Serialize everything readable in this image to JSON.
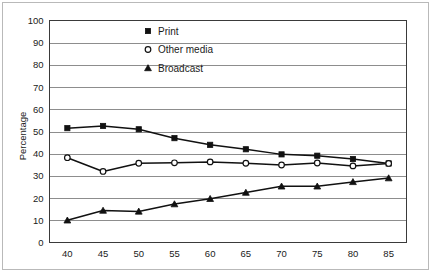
{
  "chart_data": {
    "type": "line",
    "title": "",
    "xlabel": "",
    "ylabel": "Percentage",
    "x": [
      40,
      45,
      50,
      55,
      60,
      65,
      70,
      75,
      80,
      85
    ],
    "xticklabels": [
      "40",
      "45",
      "50",
      "55",
      "60",
      "65",
      "70",
      "75",
      "80",
      "85"
    ],
    "yticklabels": [
      "0",
      "10",
      "20",
      "30",
      "40",
      "50",
      "60",
      "70",
      "80",
      "90",
      "100"
    ],
    "xlim": [
      37.5,
      87.5
    ],
    "ylim": [
      0,
      100
    ],
    "ytick_step": 10,
    "grid": true,
    "grid_axis": "y",
    "legend_position": "upper center",
    "series": [
      {
        "name": "Print",
        "marker": "filled-square",
        "color": "#111111",
        "values": [
          51.5,
          52.5,
          51.0,
          47.0,
          44.0,
          42.0,
          39.7,
          39.1,
          37.6,
          35.6
        ]
      },
      {
        "name": "Other media",
        "marker": "open-circle",
        "color": "#111111",
        "values": [
          38.2,
          32.0,
          35.7,
          35.9,
          36.3,
          35.7,
          34.9,
          35.8,
          34.5,
          35.6
        ]
      },
      {
        "name": "Broadcast",
        "marker": "filled-triangle",
        "color": "#111111",
        "values": [
          10.0,
          14.4,
          14.0,
          17.3,
          19.7,
          22.5,
          25.3,
          25.3,
          27.3,
          29.0
        ]
      }
    ]
  }
}
